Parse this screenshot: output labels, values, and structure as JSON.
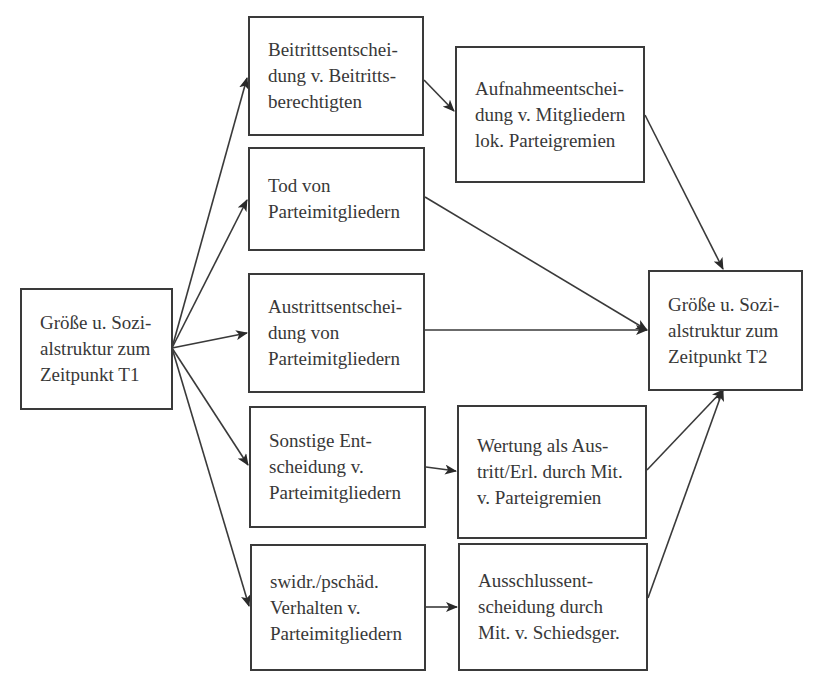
{
  "diagram": {
    "type": "flowchart",
    "colors": {
      "stroke": "#3a3a3a",
      "text": "#383838",
      "background": "#ffffff"
    },
    "nodes": [
      {
        "id": "t1",
        "lines": [
          "Größe u. Sozi-",
          "alstruktur zum",
          "Zeitpunkt T1"
        ],
        "box": [
          20,
          288,
          153,
          122
        ]
      },
      {
        "id": "beitritt",
        "lines": [
          "Beitrittsentschei-",
          "dung v. Beitritts-",
          "berechtigten"
        ],
        "box": [
          248,
          16,
          176,
          120
        ]
      },
      {
        "id": "aufnahme",
        "lines": [
          "Aufnahmeentschei-",
          "dung v. Mitgliedern",
          "lok. Parteigremien"
        ],
        "box": [
          455,
          46,
          190,
          137
        ]
      },
      {
        "id": "tod",
        "lines": [
          "Tod von",
          "Parteimitgliedern"
        ],
        "box": [
          248,
          147,
          177,
          104
        ]
      },
      {
        "id": "austritt",
        "lines": [
          "Austrittsentschei-",
          "dung von",
          "Parteimitgliedern"
        ],
        "box": [
          248,
          273,
          177,
          120
        ]
      },
      {
        "id": "sonstige",
        "lines": [
          "Sonstige Ent-",
          "scheidung v.",
          "Parteimitgliedern"
        ],
        "box": [
          249,
          406,
          177,
          122
        ]
      },
      {
        "id": "swidr",
        "lines": [
          "swidr./pschäd.",
          "Verhalten v.",
          "Parteimitgliedern"
        ],
        "box": [
          250,
          544,
          176,
          127
        ]
      },
      {
        "id": "wertung",
        "lines": [
          "Wertung als Aus-",
          "tritt/Erl. durch Mit.",
          "v. Parteigremien"
        ],
        "box": [
          457,
          405,
          190,
          134
        ]
      },
      {
        "id": "ausschluss",
        "lines": [
          "Ausschlussent-",
          "scheidung durch",
          "Mit. v. Schiedsger."
        ],
        "box": [
          458,
          543,
          190,
          128
        ]
      },
      {
        "id": "t2",
        "lines": [
          "Größe u. Sozi-",
          "alstruktur zum",
          "Zeitpunkt T2"
        ],
        "box": [
          648,
          270,
          155,
          121
        ]
      }
    ],
    "edges": [
      {
        "from": "t1",
        "to": "beitritt",
        "points": [
          172,
          348,
          247,
          78
        ]
      },
      {
        "from": "t1",
        "to": "tod",
        "points": [
          172,
          348,
          247,
          200
        ]
      },
      {
        "from": "t1",
        "to": "austritt",
        "points": [
          172,
          348,
          247,
          333
        ]
      },
      {
        "from": "t1",
        "to": "sonstige",
        "points": [
          172,
          348,
          248,
          465
        ]
      },
      {
        "from": "t1",
        "to": "swidr",
        "points": [
          172,
          348,
          249,
          606
        ]
      },
      {
        "from": "beitritt",
        "to": "aufnahme",
        "points": [
          424,
          80,
          454,
          111
        ]
      },
      {
        "from": "aufnahme",
        "to": "t2",
        "points": [
          645,
          115,
          723,
          269
        ]
      },
      {
        "from": "tod",
        "to": "t2",
        "points": [
          425,
          197,
          647,
          330
        ]
      },
      {
        "from": "austritt",
        "to": "t2",
        "points": [
          425,
          330,
          647,
          330
        ]
      },
      {
        "from": "sonstige",
        "to": "wertung",
        "points": [
          426,
          467,
          456,
          471
        ]
      },
      {
        "from": "swidr",
        "to": "ausschluss",
        "points": [
          426,
          607,
          457,
          607
        ]
      },
      {
        "from": "wertung",
        "to": "t2",
        "points": [
          647,
          470,
          723,
          390
        ]
      },
      {
        "from": "ausschluss",
        "to": "t2",
        "points": [
          648,
          598,
          723,
          390
        ]
      }
    ]
  }
}
